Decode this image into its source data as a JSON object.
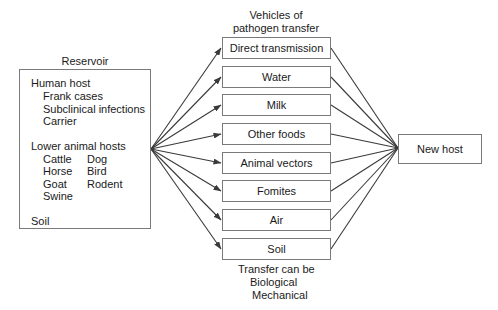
{
  "reservoir": {
    "title": "Reservoir",
    "human_host": {
      "heading": "Human host",
      "items": [
        "Frank cases",
        "Subclinical infections",
        "Carrier"
      ]
    },
    "lower_animal_hosts": {
      "heading": "Lower animal hosts",
      "col1": [
        "Cattle",
        "Horse",
        "Goat",
        "Swine"
      ],
      "col2": [
        "Dog",
        "Bird",
        "Rodent"
      ]
    },
    "soil": "Soil"
  },
  "vehicles": {
    "title_line1": "Vehicles of",
    "title_line2": "pathogen transfer",
    "items": [
      {
        "label": "Direct transmission"
      },
      {
        "label": "Water"
      },
      {
        "label": "Milk"
      },
      {
        "label": "Other foods"
      },
      {
        "label": "Animal vectors"
      },
      {
        "label": "Fomites"
      },
      {
        "label": "Air"
      },
      {
        "label": "Soil"
      }
    ],
    "footer_line1": "Transfer can be",
    "footer_line2": "Biological",
    "footer_line3": "Mechanical"
  },
  "new_host": {
    "label": "New host"
  },
  "colors": {
    "line": "#3a3a3a",
    "box_border": "#7a7a7a",
    "text": "#1a1a1a"
  }
}
